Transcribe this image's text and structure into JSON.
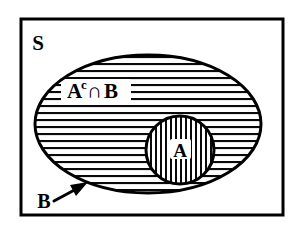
{
  "diagram": {
    "type": "venn-set-diagram",
    "background_color": "#ffffff",
    "ink_color": "#000000",
    "canvas": {
      "width": 302,
      "height": 233
    }
  },
  "universe": {
    "name": "sample-space",
    "label": "S",
    "shape": "rectangle",
    "label_x": 38,
    "label_y": 50,
    "rect": {
      "x": 21,
      "y": 19,
      "width": 262,
      "height": 196
    },
    "border_width": 3,
    "border_color": "#000000",
    "fill": "#ffffff"
  },
  "sets": [
    {
      "name": "set-b",
      "label": "B",
      "shape": "ellipse",
      "hatch": "horizontal",
      "hatch_spacing": 7,
      "hatch_width": 2,
      "cx": 148,
      "cy": 124,
      "rx": 113,
      "ry": 69,
      "stroke_width": 3,
      "stroke_color": "#000000",
      "label_x": 44,
      "label_y": 207
    },
    {
      "name": "set-a",
      "label": "A",
      "shape": "circle",
      "hatch": "vertical",
      "hatch_spacing": 5,
      "hatch_width": 2,
      "cx": 180,
      "cy": 150,
      "r": 34,
      "stroke_width": 3,
      "stroke_color": "#000000",
      "label_x": 180,
      "label_y": 157
    }
  ],
  "region_labels": [
    {
      "name": "a-complement-intersect-b",
      "base": "A",
      "superscript": "c",
      "operator": "∩",
      "operand": "B",
      "full_text": "Aᶜ∩B",
      "x": 67,
      "y": 95
    }
  ],
  "annotations": [
    {
      "name": "b-pointer-arrow",
      "kind": "arrow",
      "points_to": "set-b-boundary",
      "tail_x": 54,
      "tail_y": 201,
      "head_x": 86,
      "head_y": 184,
      "stroke_width": 3,
      "color": "#000000"
    }
  ]
}
